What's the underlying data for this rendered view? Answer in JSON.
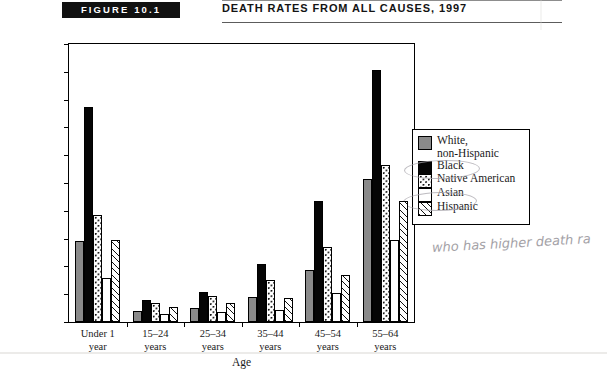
{
  "header": {
    "badge": "FIGURE 10.1",
    "title": "DEATH RATES FROM ALL CAUSES, 1997"
  },
  "annotation": {
    "handwritten_note": "who has higher death ra"
  },
  "chart_data": {
    "type": "bar",
    "title": "Death Rates from All Causes, 1997",
    "xlabel": "Age",
    "ylabel": "Deaths per 100,000 Population",
    "ylim": [
      0,
      2000
    ],
    "ytick_step": 200,
    "grid": false,
    "legend_position": "right",
    "ytick_labels": [
      "2,000",
      "1,800",
      "1,600",
      "1,400",
      "1,200",
      "1,000",
      "800",
      "600",
      "400",
      "200",
      "0"
    ],
    "ytick_values": [
      2000,
      1800,
      1600,
      1400,
      1200,
      1000,
      800,
      600,
      400,
      200,
      0
    ],
    "categories": [
      "Under 1 year",
      "15-24 years",
      "25-34 years",
      "35-44 years",
      "45-54 years",
      "55-64 years"
    ],
    "category_lines": [
      [
        "Under 1",
        "year"
      ],
      [
        "15–24",
        "years"
      ],
      [
        "25–34",
        "years"
      ],
      [
        "35–44",
        "years"
      ],
      [
        "45–54",
        "years"
      ],
      [
        "55–64",
        "years"
      ]
    ],
    "series": [
      {
        "name": "White, non-Hispanic",
        "name_lines": [
          "White,",
          "non-Hispanic"
        ],
        "pattern": "solid-gray",
        "color": "#8a8a8a",
        "values": [
          580,
          80,
          100,
          180,
          375,
          1030
        ]
      },
      {
        "name": "Black",
        "name_lines": [
          "Black"
        ],
        "pattern": "solid-black",
        "color": "#050505",
        "values": [
          1550,
          155,
          215,
          420,
          870,
          1810
        ]
      },
      {
        "name": "Native American",
        "name_lines": [
          "Native American"
        ],
        "pattern": "dotted",
        "color": "#ffffff",
        "values": [
          770,
          140,
          190,
          300,
          540,
          1130
        ]
      },
      {
        "name": "Asian",
        "name_lines": [
          "Asian"
        ],
        "pattern": "blank-white",
        "color": "#ffffff",
        "values": [
          320,
          60,
          70,
          90,
          210,
          590
        ]
      },
      {
        "name": "Hispanic",
        "name_lines": [
          "Hispanic"
        ],
        "pattern": "diagonal-hatch",
        "color": "#ffffff",
        "values": [
          590,
          110,
          135,
          175,
          340,
          870
        ]
      }
    ]
  }
}
